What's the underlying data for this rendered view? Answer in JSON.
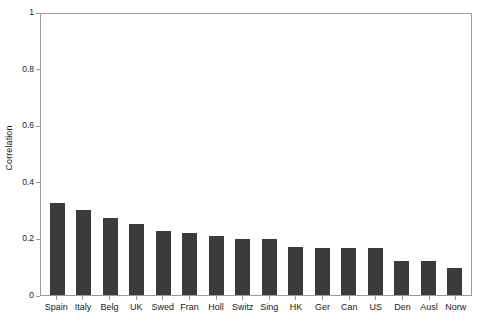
{
  "chart_data": {
    "type": "bar",
    "title": "",
    "xlabel": "",
    "ylabel": "Correlation",
    "ylim": [
      0,
      1
    ],
    "yticks": [
      "0",
      "0.2",
      "0.4",
      "0.6",
      "0.8",
      "1"
    ],
    "ytick_values": [
      0,
      0.2,
      0.4,
      0.6,
      0.8,
      1
    ],
    "grid": false,
    "legend": false,
    "bar_color": "#3b3b3b",
    "axis_color": "#9a9a9a",
    "background": "#ffffff",
    "categories": [
      "Spain",
      "Italy",
      "Belg",
      "UK",
      "Swed",
      "Fran",
      "Holl",
      "Switz",
      "Sing",
      "HK",
      "Ger",
      "Can",
      "US",
      "Den",
      "Ausl",
      "Norw"
    ],
    "values": [
      0.325,
      0.3,
      0.272,
      0.25,
      0.225,
      0.22,
      0.21,
      0.198,
      0.197,
      0.17,
      0.165,
      0.165,
      0.165,
      0.12,
      0.12,
      0.095
    ]
  }
}
